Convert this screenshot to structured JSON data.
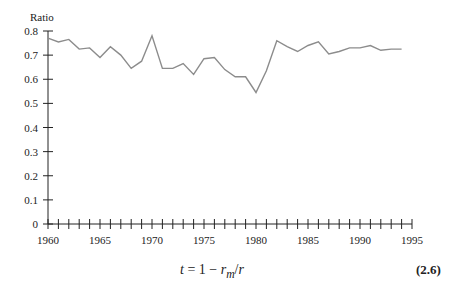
{
  "chart_data": {
    "type": "line",
    "title": "",
    "xlabel": "",
    "ylabel": "Ratio",
    "xlim": [
      1960,
      1995
    ],
    "ylim": [
      0,
      0.8
    ],
    "grid": false,
    "legend": null,
    "x_tick_labels": [
      "1960",
      "1965",
      "1970",
      "1975",
      "1980",
      "1985",
      "1990",
      "1995"
    ],
    "y_tick_labels": [
      "0",
      "0.1",
      "0.2",
      "0.3",
      "0.4",
      "0.5",
      "0.6",
      "0.7",
      "0.8"
    ],
    "x_minor_tick_step": 1,
    "series": [
      {
        "name": "Ratio",
        "color": "#8c8c8c",
        "x": [
          1960,
          1961,
          1962,
          1963,
          1964,
          1965,
          1966,
          1967,
          1968,
          1969,
          1970,
          1971,
          1972,
          1973,
          1974,
          1975,
          1976,
          1977,
          1978,
          1979,
          1980,
          1981,
          1982,
          1983,
          1984,
          1985,
          1986,
          1987,
          1988,
          1989,
          1990,
          1991,
          1992,
          1993,
          1994
        ],
        "values": [
          0.77,
          0.755,
          0.765,
          0.725,
          0.73,
          0.69,
          0.735,
          0.7,
          0.645,
          0.675,
          0.78,
          0.645,
          0.645,
          0.665,
          0.62,
          0.685,
          0.69,
          0.64,
          0.61,
          0.61,
          0.545,
          0.635,
          0.76,
          0.735,
          0.715,
          0.74,
          0.755,
          0.705,
          0.715,
          0.73,
          0.73,
          0.74,
          0.72,
          0.725,
          0.725
        ]
      }
    ]
  },
  "equation": {
    "lhs": "t",
    "equals": " = 1 − ",
    "r": "r",
    "sub": "m",
    "slash": "/",
    "r2": "r",
    "number": "(2.6)"
  }
}
